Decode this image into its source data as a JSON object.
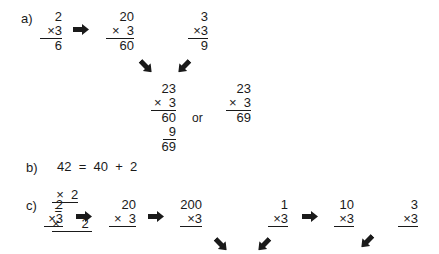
{
  "part_a": {
    "label": "a)",
    "step1": {
      "top": "2",
      "mult": "×3",
      "result": "6"
    },
    "step2": {
      "top": "20",
      "mult": "×  3",
      "result": "60"
    },
    "step3": {
      "top": "3",
      "mult": "×3",
      "result": "9"
    },
    "combined_long": {
      "top": "23",
      "mult": "×  3",
      "partial1": "60",
      "partial2": "9",
      "result": "69"
    },
    "or_text": "or",
    "combined_short": {
      "top": "23",
      "mult": "×  3",
      "result": "69"
    }
  },
  "part_b": {
    "label": "b)",
    "line1": "42  =  40  +  2",
    "line2_left": "×  2",
    "line2_eq": "=",
    "line2_right": "×      2"
  },
  "part_c": {
    "label": "c)",
    "p1": {
      "top": "2",
      "mult": "×3"
    },
    "p2": {
      "top": "20",
      "mult": "×  3"
    },
    "p3": {
      "top": "200",
      "mult": "×3"
    },
    "p4": {
      "top": "1",
      "mult": "×3"
    },
    "p5": {
      "top": "10",
      "mult": "×3"
    },
    "p6": {
      "top": "3",
      "mult": "×3"
    }
  },
  "icons": {
    "arrow_color": "#1a1a1a"
  }
}
